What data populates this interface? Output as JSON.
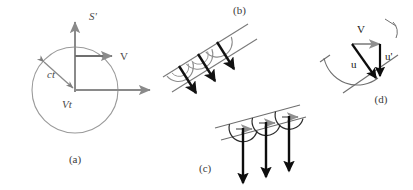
{
  "figure": {
    "type": "physics-diagram",
    "background_color": "#ffffff",
    "colors": {
      "gray_vector": "#8a8a8a",
      "gray_line": "#9a9a9a",
      "black_vector": "#111111",
      "arc_gray": "#8d8d8d",
      "text_dark": "#1a1a1a",
      "text_gray": "#4a4a4a"
    },
    "panels": [
      {
        "id": "a",
        "caption": "(a)",
        "labels": {
          "vertical_axis": "S'",
          "velocity": "V",
          "radius": "ct",
          "displacement": "Vt"
        },
        "elements": [
          "circle",
          "vertical-axis-arrow",
          "horizontal-axis-arrow",
          "velocity-arrow",
          "radius-arrow"
        ]
      },
      {
        "id": "b",
        "caption": "(b)",
        "elements": [
          "wavefront-line-upper",
          "wavefront-line-lower",
          "huygens-arcs",
          "ray-arrows-perpendicular"
        ],
        "arc_count": 3,
        "arrow_count": 3
      },
      {
        "id": "c",
        "caption": "(c)",
        "elements": [
          "wavefront-line-upper",
          "wavefront-line-lower",
          "huygens-arcs",
          "drift-arrows-gray",
          "ray-arrows-vertical"
        ],
        "arc_count": 3,
        "arrow_count": 3,
        "drift_arrow_count": 3
      },
      {
        "id": "d",
        "caption": "(d)",
        "labels": {
          "velocity": "V",
          "ray_rest": "u",
          "ray_moving": "u'"
        },
        "elements": [
          "tilted-wavefront-line",
          "wavelet-arc",
          "u-vector",
          "u-prime-vector",
          "V-vector-gray",
          "angle-tick"
        ]
      }
    ]
  }
}
